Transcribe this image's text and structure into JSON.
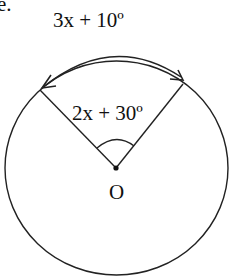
{
  "text_fragment": "e.",
  "diagram": {
    "type": "circle-central-angle",
    "arc_label": "3x + 10º",
    "central_angle_label": "2x + 30º",
    "center_label": "O",
    "stroke_color": "#222222",
    "background": "#ffffff"
  }
}
